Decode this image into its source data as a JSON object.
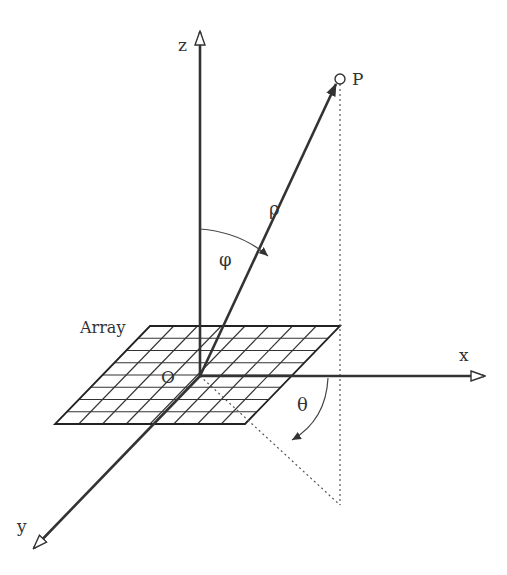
{
  "diagram": {
    "labels": {
      "z_axis": "z",
      "x_axis": "x",
      "y_axis": "y",
      "origin": "O",
      "point": "P",
      "rho": "ρ",
      "phi": "φ",
      "theta": "θ",
      "array": "Array"
    },
    "array_grid": {
      "rows": 8,
      "cols": 8
    },
    "colors": {
      "line": "#333333",
      "background": "#ffffff"
    }
  }
}
